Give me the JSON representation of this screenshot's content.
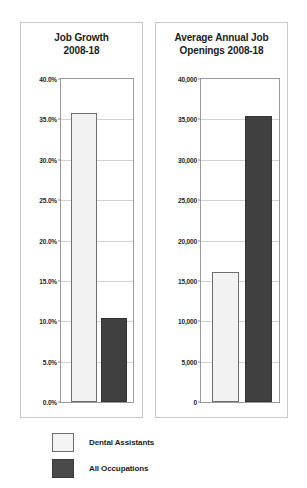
{
  "chart_data": [
    {
      "type": "bar",
      "title": "Job Growth 2008-18",
      "title_line1": "Job Growth",
      "title_line2": "2008-18",
      "xlabel": "",
      "ylabel": "",
      "ylim": [
        0,
        40
      ],
      "grid": true,
      "yticks": [
        "0.0%",
        "5.0%",
        "10.0%",
        "15.0%",
        "20.0%",
        "25.0%",
        "30.0%",
        "35.0%",
        "40.0%"
      ],
      "ytick_values": [
        0,
        5,
        10,
        15,
        20,
        25,
        30,
        35,
        40
      ],
      "categories": [
        "Dental Assistants",
        "All Occupations"
      ],
      "values": [
        35.8,
        10.4
      ],
      "value_labels": [
        "35.8%",
        "10.4%"
      ]
    },
    {
      "type": "bar",
      "title": "Average Annual Job Openings 2008-18",
      "title_line1": "Average Annual Job",
      "title_line2": "Openings 2008-18",
      "xlabel": "",
      "ylabel": "",
      "ylim": [
        0,
        40000
      ],
      "grid": true,
      "yticks": [
        "0",
        "5,000",
        "10,000",
        "15,000",
        "20,000",
        "25,000",
        "30,000",
        "35,000",
        "40,000"
      ],
      "ytick_values": [
        0,
        5000,
        10000,
        15000,
        20000,
        25000,
        30000,
        35000,
        40000
      ],
      "categories": [
        "Dental Assistants",
        "All Occupations"
      ],
      "values": [
        16100,
        35400
      ],
      "value_labels": [
        "16,100",
        "35,400"
      ]
    }
  ],
  "legend": {
    "position": "below",
    "items": [
      {
        "label": "Dental Assistants",
        "color": "#f4f4f4",
        "swatch": "light"
      },
      {
        "label": "All Occupations",
        "color": "#4a4a4a",
        "swatch": "dark"
      }
    ]
  },
  "colors": {
    "series_dental_assistants": "#f2f2f2",
    "series_all_occupations": "#404040",
    "panel_border": "#c9c9c9",
    "axis": "#9a9a9a",
    "gridline": "#d2d2d2",
    "text": "#1c1c1c",
    "background": "#ffffff"
  }
}
